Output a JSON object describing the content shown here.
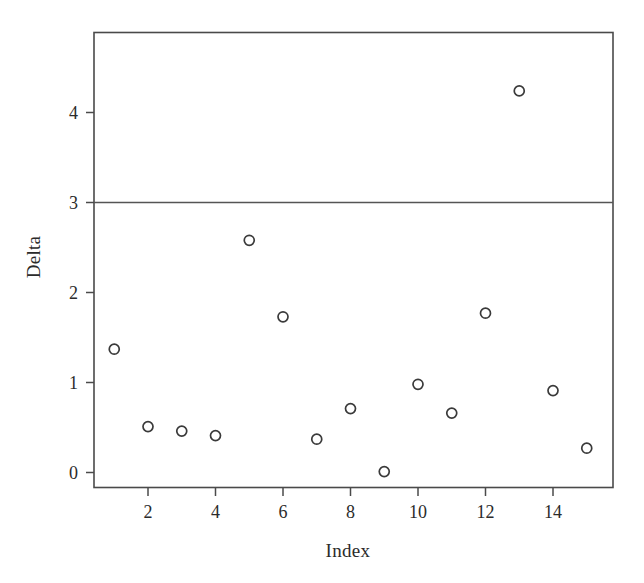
{
  "chart_data": {
    "type": "scatter",
    "title": "",
    "xlabel": "Index",
    "ylabel": "Delta",
    "x": [
      1,
      2,
      3,
      4,
      5,
      6,
      7,
      8,
      9,
      10,
      11,
      12,
      13,
      14,
      15
    ],
    "values": [
      1.37,
      0.51,
      0.46,
      0.41,
      2.58,
      1.73,
      0.37,
      0.71,
      0.01,
      0.98,
      0.66,
      1.77,
      4.24,
      0.91,
      0.27
    ],
    "series": [
      {
        "name": "Delta",
        "values": [
          1.37,
          0.51,
          0.46,
          0.41,
          2.58,
          1.73,
          0.37,
          0.71,
          0.01,
          0.98,
          0.66,
          1.77,
          4.24,
          0.91,
          0.27
        ]
      }
    ],
    "xlim": [
      0.35,
      15.65
    ],
    "ylim": [
      -0.17,
      4.72
    ],
    "xticks": [
      2,
      4,
      6,
      8,
      10,
      12,
      14
    ],
    "xtick_labels": [
      "2",
      "4",
      "6",
      "8",
      "10",
      "12",
      "14"
    ],
    "yticks": [
      0,
      1,
      2,
      3,
      4
    ],
    "ytick_labels": [
      "0",
      "1",
      "2",
      "3",
      "4"
    ],
    "grid": false,
    "legend": null,
    "annotations": [
      {
        "type": "hline",
        "label": "reference line",
        "y": 3.0,
        "color": "#555555"
      }
    ],
    "marker": {
      "shape": "open-circle",
      "size": 10,
      "edge_color": "#3a3a3a",
      "fill": "none"
    },
    "frame_color": "#4a4a4a",
    "background_color": "#ffffff"
  },
  "figure": {
    "x_axis_title": "Index",
    "y_axis_title": "Delta"
  }
}
